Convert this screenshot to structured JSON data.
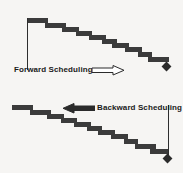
{
  "figure": {
    "background_color": "#f6f5f3",
    "bar_color": "#3b3b3b",
    "line_color": "#2e2e2e"
  },
  "charts": [
    {
      "id": "forward-scheduling",
      "label": "Forward Scheduling",
      "arrow_icon": "arrow-right-icon",
      "arrow_direction": "right",
      "anchor_side": "left",
      "milestone_icon": "milestone-diamond-icon",
      "bars": [
        {
          "x": 28,
          "y": 18,
          "w": 20,
          "h": 5
        },
        {
          "x": 45,
          "y": 23,
          "w": 21,
          "h": 5
        },
        {
          "x": 62,
          "y": 27,
          "w": 17,
          "h": 5
        },
        {
          "x": 76,
          "y": 31,
          "w": 16,
          "h": 5
        },
        {
          "x": 89,
          "y": 35,
          "w": 17,
          "h": 5
        },
        {
          "x": 102,
          "y": 39,
          "w": 15,
          "h": 5
        },
        {
          "x": 112,
          "y": 43,
          "w": 17,
          "h": 5
        },
        {
          "x": 125,
          "y": 47,
          "w": 17,
          "h": 5
        },
        {
          "x": 138,
          "y": 52,
          "w": 14,
          "h": 5
        },
        {
          "x": 148,
          "y": 57,
          "w": 21,
          "h": 5
        }
      ],
      "axis": {
        "x": 27,
        "y": 18,
        "h": 52
      },
      "milestone": {
        "x": 163,
        "y": 63
      }
    },
    {
      "id": "backward-scheduling",
      "label": "Backward Scheduling",
      "arrow_icon": "arrow-left-icon",
      "arrow_direction": "left",
      "anchor_side": "right",
      "milestone_icon": "milestone-diamond-icon",
      "bars": [
        {
          "x": 12,
          "y": 105,
          "w": 21,
          "h": 5
        },
        {
          "x": 30,
          "y": 110,
          "w": 21,
          "h": 5
        },
        {
          "x": 47,
          "y": 114,
          "w": 17,
          "h": 5
        },
        {
          "x": 61,
          "y": 118,
          "w": 16,
          "h": 5
        },
        {
          "x": 74,
          "y": 122,
          "w": 17,
          "h": 5
        },
        {
          "x": 87,
          "y": 126,
          "w": 15,
          "h": 5
        },
        {
          "x": 98,
          "y": 130,
          "w": 17,
          "h": 5
        },
        {
          "x": 111,
          "y": 134,
          "w": 17,
          "h": 5
        },
        {
          "x": 124,
          "y": 139,
          "w": 14,
          "h": 5
        },
        {
          "x": 135,
          "y": 144,
          "w": 21,
          "h": 5
        },
        {
          "x": 150,
          "y": 149,
          "w": 18,
          "h": 5
        }
      ],
      "axis": {
        "x": 168,
        "y": 105,
        "h": 53
      },
      "milestone": {
        "x": 164,
        "y": 155
      }
    }
  ]
}
